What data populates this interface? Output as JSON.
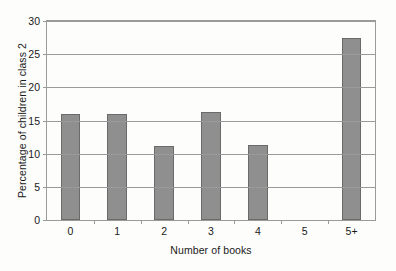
{
  "chart_data": {
    "type": "bar",
    "title": "",
    "xlabel": "Number of books",
    "ylabel": "Percentage of children in class 2",
    "categories": [
      "0",
      "1",
      "2",
      "3",
      "4",
      "5",
      "5+"
    ],
    "values": [
      16.0,
      16.0,
      11.1,
      16.3,
      11.3,
      0,
      27.5
    ],
    "ylim": [
      0,
      30
    ],
    "yticks": [
      "0",
      "5",
      "10",
      "15",
      "20",
      "25",
      "30"
    ],
    "ytick_values": [
      0,
      5,
      10,
      15,
      20,
      25,
      30
    ],
    "grid": "horizontal",
    "legend": "none",
    "bar_color": "#8f8f8f",
    "bar_edge_color": "#6a6a6a",
    "axis_color": "#9a9a9a",
    "background_color": "#fdfdfc"
  }
}
